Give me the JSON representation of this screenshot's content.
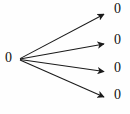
{
  "figure": {
    "kind": "directed-fan-graph",
    "width": 130,
    "height": 114,
    "background_color": "#fefefe",
    "stroke_color": "#1a1a1a",
    "label_color": "#111111"
  },
  "source_node": {
    "id": "source",
    "label": "0",
    "x": 19,
    "y": 59
  },
  "target_nodes": [
    {
      "id": "target-0",
      "label": "0",
      "x": 109,
      "y": 13
    },
    {
      "id": "target-1",
      "label": "0",
      "x": 109,
      "y": 44
    },
    {
      "id": "target-2",
      "label": "0",
      "x": 109,
      "y": 72
    },
    {
      "id": "target-3",
      "label": "0",
      "x": 109,
      "y": 98
    }
  ],
  "edges": [
    {
      "id": "edge-0",
      "from": "source",
      "to": "target-0",
      "arrow": true
    },
    {
      "id": "edge-1",
      "from": "source",
      "to": "target-1",
      "arrow": true
    },
    {
      "id": "edge-2",
      "from": "source",
      "to": "target-2",
      "arrow": true
    },
    {
      "id": "edge-3",
      "from": "source",
      "to": "target-3",
      "arrow": true
    }
  ]
}
